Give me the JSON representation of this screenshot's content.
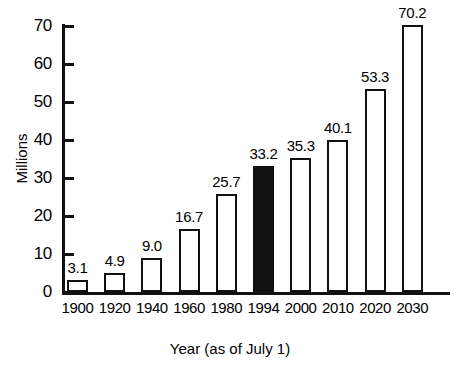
{
  "chart_data": {
    "type": "bar",
    "title": "",
    "xlabel": "Year (as of July 1)",
    "ylabel": "Millions",
    "categories": [
      "1900",
      "1920",
      "1940",
      "1960",
      "1980",
      "1994",
      "2000",
      "2010",
      "2020",
      "2030"
    ],
    "values": [
      3.1,
      4.9,
      9.0,
      16.7,
      25.7,
      33.2,
      35.3,
      40.1,
      53.3,
      70.2
    ],
    "value_labels": [
      "3.1",
      "4.9",
      "9.0",
      "16.7",
      "25.7",
      "33.2",
      "35.3",
      "40.1",
      "53.3",
      "70.2"
    ],
    "ylim": [
      0,
      70
    ],
    "yticks": [
      0,
      10,
      20,
      30,
      40,
      50,
      60,
      70
    ],
    "ytick_labels": [
      "0",
      "10",
      "20",
      "30",
      "40",
      "50",
      "60",
      "70"
    ],
    "grid": false,
    "legend": null,
    "highlighted_category": "1994",
    "bar_fill_default": "#ffffff",
    "bar_fill_highlight": "#111111",
    "bar_edge_color": "#111111",
    "background_color": "#ffffff"
  }
}
